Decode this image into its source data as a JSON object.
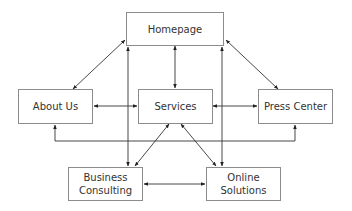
{
  "diagram": {
    "type": "site-map",
    "nodes": [
      {
        "id": "homepage",
        "label": "Homepage"
      },
      {
        "id": "about",
        "label": "About Us"
      },
      {
        "id": "services",
        "label": "Services"
      },
      {
        "id": "press",
        "label": "Press Center"
      },
      {
        "id": "business",
        "label": "Business\nConsulting",
        "line1": "Business",
        "line2": "Consulting"
      },
      {
        "id": "online",
        "label": "Online\nSolutions",
        "line1": "Online",
        "line2": "Solutions"
      }
    ],
    "edges": [
      {
        "from": "homepage",
        "to": "about",
        "direction": "both"
      },
      {
        "from": "homepage",
        "to": "services",
        "direction": "both"
      },
      {
        "from": "homepage",
        "to": "press",
        "direction": "both"
      },
      {
        "from": "homepage",
        "to": "business",
        "direction": "both"
      },
      {
        "from": "homepage",
        "to": "online",
        "direction": "both"
      },
      {
        "from": "about",
        "to": "services",
        "direction": "both"
      },
      {
        "from": "services",
        "to": "press",
        "direction": "both"
      },
      {
        "from": "about",
        "to": "press",
        "direction": "both"
      },
      {
        "from": "services",
        "to": "business",
        "direction": "both"
      },
      {
        "from": "services",
        "to": "online",
        "direction": "both"
      },
      {
        "from": "business",
        "to": "online",
        "direction": "both"
      }
    ]
  }
}
